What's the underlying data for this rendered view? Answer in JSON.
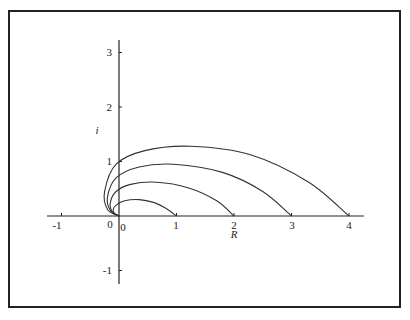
{
  "chart_data": {
    "type": "line",
    "title": "",
    "xlabel": "R",
    "ylabel": "i",
    "xlim": [
      -1.25,
      4.25
    ],
    "ylim": [
      -1.25,
      3.25
    ],
    "grid": false,
    "legend": null,
    "x_ticks": [
      -1,
      0,
      1,
      2,
      3,
      4
    ],
    "y_ticks": [
      -1,
      1,
      2,
      3
    ],
    "x_tick_labels": [
      "-1",
      "0",
      "1",
      "2",
      "3",
      "4"
    ],
    "y_tick_labels": [
      "-1",
      "1",
      "2",
      "3"
    ],
    "origin_label": "0",
    "series": [
      {
        "name": "curve-1",
        "end_x": 1,
        "peak": [
          0.35,
          0.3
        ],
        "leftmost_x": -0.1,
        "points": [
          [
            0,
            0
          ],
          [
            -0.08,
            0.05
          ],
          [
            -0.1,
            0.12
          ],
          [
            -0.05,
            0.2
          ],
          [
            0.1,
            0.28
          ],
          [
            0.35,
            0.3
          ],
          [
            0.6,
            0.25
          ],
          [
            0.8,
            0.15
          ],
          [
            1,
            0
          ]
        ]
      },
      {
        "name": "curve-2",
        "end_x": 2,
        "peak": [
          0.65,
          0.62
        ],
        "leftmost_x": -0.15,
        "points": [
          [
            0,
            0
          ],
          [
            -0.12,
            0.08
          ],
          [
            -0.15,
            0.25
          ],
          [
            -0.05,
            0.45
          ],
          [
            0.2,
            0.58
          ],
          [
            0.65,
            0.62
          ],
          [
            1.2,
            0.52
          ],
          [
            1.7,
            0.28
          ],
          [
            2,
            0
          ]
        ]
      },
      {
        "name": "curve-3",
        "end_x": 3,
        "peak": [
          0.95,
          0.95
        ],
        "leftmost_x": -0.2,
        "points": [
          [
            0,
            0
          ],
          [
            -0.15,
            0.1
          ],
          [
            -0.2,
            0.35
          ],
          [
            -0.05,
            0.7
          ],
          [
            0.35,
            0.9
          ],
          [
            0.95,
            0.95
          ],
          [
            1.8,
            0.8
          ],
          [
            2.5,
            0.45
          ],
          [
            3,
            0
          ]
        ]
      },
      {
        "name": "curve-4",
        "end_x": 4,
        "peak": [
          1.25,
          1.28
        ],
        "leftmost_x": -0.25,
        "points": [
          [
            0,
            0
          ],
          [
            -0.2,
            0.12
          ],
          [
            -0.25,
            0.45
          ],
          [
            -0.05,
            0.95
          ],
          [
            0.45,
            1.2
          ],
          [
            1.25,
            1.28
          ],
          [
            2.3,
            1.12
          ],
          [
            3.3,
            0.62
          ],
          [
            4,
            0
          ]
        ]
      }
    ]
  },
  "axes": {
    "x_label": "R",
    "y_label": "i",
    "origin_label": "0",
    "x_ticks": [
      "-1",
      "0",
      "1",
      "2",
      "3",
      "4"
    ],
    "y_ticks": [
      "3",
      "2",
      "1",
      "-1"
    ]
  }
}
